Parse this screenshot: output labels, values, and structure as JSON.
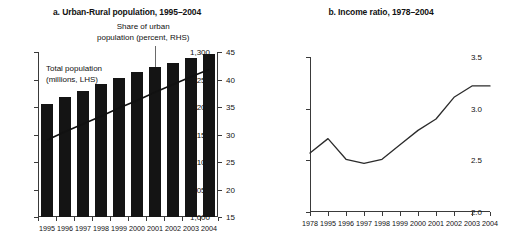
{
  "chart_data": [
    {
      "type": "bar",
      "panel": "a",
      "title": "a. Urban-Rural population, 1995–2004",
      "categories": [
        "1995",
        "1996",
        "1997",
        "1998",
        "1999",
        "2000",
        "2001",
        "2002",
        "2003",
        "2004"
      ],
      "xlabel": "",
      "ylabel": "",
      "ylim": [
        1000,
        1300
      ],
      "yticks": [
        "1,000",
        "1,050",
        "1,100",
        "1,150",
        "1,200",
        "1,250",
        "1,300"
      ],
      "ytick_values": [
        1000,
        1050,
        1100,
        1150,
        1200,
        1250,
        1300
      ],
      "y2lim": [
        15,
        45
      ],
      "y2ticks": [
        "15",
        "20",
        "25",
        "30",
        "35",
        "40",
        "45"
      ],
      "y2tick_values": [
        15,
        20,
        25,
        30,
        35,
        40,
        45
      ],
      "grid": false,
      "legend": "none",
      "series": [
        {
          "name": "Total population (millions, LHS)",
          "type": "bar",
          "axis": "left",
          "values": [
            1205,
            1218,
            1230,
            1242,
            1253,
            1263,
            1272,
            1280,
            1290,
            1297
          ]
        },
        {
          "name": "Share of urban population (percent, RHS)",
          "type": "line",
          "axis": "right",
          "values": [
            29.0,
            30.5,
            31.9,
            33.3,
            34.8,
            36.2,
            37.7,
            39.1,
            40.5,
            41.8
          ]
        }
      ],
      "annotations": [
        {
          "id": "total-population",
          "text_line1": "Total population",
          "text_line2": "(millions, LHS)"
        },
        {
          "id": "share-urban",
          "text_line1": "Share of urban",
          "text_line2": "population (percent, RHS)"
        }
      ]
    },
    {
      "type": "line",
      "panel": "b",
      "title": "b. Income ratio, 1978–2004",
      "categories": [
        "1978",
        "1995",
        "1996",
        "1997",
        "1998",
        "1999",
        "2000",
        "2001",
        "2002",
        "2003",
        "2004"
      ],
      "xlabel": "",
      "ylabel": "",
      "ylim": [
        2.0,
        3.5
      ],
      "yticks": [
        "2.0",
        "2.5",
        "3.0",
        "3.5"
      ],
      "ytick_values": [
        2.0,
        2.5,
        3.0,
        3.5
      ],
      "grid": false,
      "legend": "none",
      "series": [
        {
          "name": "Income ratio",
          "type": "line",
          "values": [
            2.57,
            2.71,
            2.51,
            2.47,
            2.51,
            2.65,
            2.79,
            2.9,
            3.11,
            3.22,
            3.22
          ]
        }
      ]
    }
  ],
  "colors": {
    "bar": "#141414",
    "line": "#2b2b2b",
    "axis": "#3a3a3a",
    "text": "#111111",
    "background": "#ffffff"
  }
}
